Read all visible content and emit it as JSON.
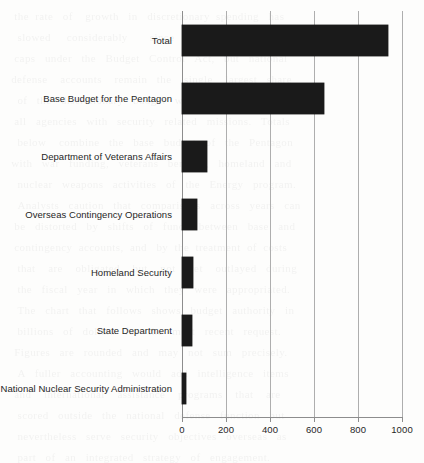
{
  "figure": {
    "background_color": "#fdfdfc",
    "bar_color": "#1a1a1a",
    "axis_color": "#8d8d8d",
    "gridline_color": "#aeaeae"
  },
  "background_bleed": {
    "text": "  the  rate   of    growth   in   discretionary  spending   has\n   slowed     considerably       since     the    enactment    of\n  caps   under   the   Budget   Control   Act,   but   national\n defense    accounts    remain   the    single    largest   share\n   of   the   discretionary   budget   when   measured   across\n  all   agencies   with   security   related   missions.   Totals\n   below    combine   the   base   budget   of   the   Pentagon\n with   war   funding,   veterans   benefits,   homeland   and\n   nuclear   weapons   activities   of   the   Energy   program.\n   Analysts   caution   that   comparisons   across   years   can\n  be   distorted   by   shifts   of   funds   between   base   and\n  contingency  accounts,  and   by  the  treatment  of  costs\n   that    are    obligated    but    not    yet    outlayed   during\n   the   fiscal   year   in   which   they   were   appropriated.\n   The   chart   that   follows   shows   budget   authority   in\n   billions   of   dollars   for   the   most   recent   request.\n  Figures   are   rounded   and   may   not   sum   precisely.\n   A   fuller   accounting   would   add   intelligence   items\n  and    international    assistance    programs    that    are\n   scored   outside   the   national   defense   function   but\n   nevertheless   serve   security   objectives   overseas   as\n   part   of   an   integrated   strategy   of   engagement."
  },
  "chart_data": {
    "type": "bar",
    "orientation": "horizontal",
    "title": "",
    "subtitle": "",
    "xlabel": "",
    "ylabel": "",
    "xlim": [
      0,
      1000
    ],
    "xticks": [
      0,
      200,
      400,
      600,
      800,
      1000
    ],
    "xtick_labels": [
      "0",
      "200",
      "400",
      "600",
      "800",
      "1000"
    ],
    "grid": true,
    "grid_axis": "x",
    "legend": false,
    "legend_position": "none",
    "categories": [
      "Total",
      "Base Budget for the Pentagon",
      "Department of Veterans Affairs",
      "Overseas Contingency Operations",
      "Homeland Security",
      "State Department",
      "National Nuclear Security Administration"
    ],
    "values": [
      936,
      645,
      114,
      70,
      50,
      45,
      19
    ],
    "bar_color": "#1a1a1a"
  }
}
